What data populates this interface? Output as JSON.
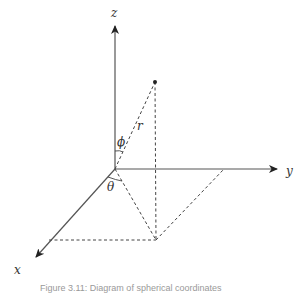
{
  "diagram": {
    "title": "Spherical coordinates",
    "axes": {
      "z": {
        "label": "z"
      },
      "y": {
        "label": "y"
      },
      "x": {
        "label": "x"
      }
    },
    "angles": {
      "phi": {
        "label": "ϕ"
      },
      "theta": {
        "label": "θ"
      }
    },
    "radius": {
      "label": "r"
    },
    "colors": {
      "axis": "#555555",
      "dashed": "#444444",
      "label": "#333333",
      "background": "#ffffff"
    }
  },
  "caption": {
    "text": "Figure 3.11: Diagram of spherical coordinates"
  }
}
